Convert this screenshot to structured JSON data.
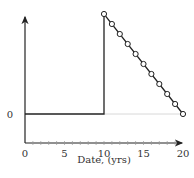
{
  "chart_data": {
    "type": "line",
    "title": "",
    "xlabel": "Date, (yrs)",
    "ylabel": "",
    "xlim": [
      0,
      20
    ],
    "x_ticks": [
      0,
      5,
      10,
      15,
      20
    ],
    "x_tick_labels": [
      "0",
      "5",
      "10",
      "15",
      "20"
    ],
    "x_minor_ticks_every": 1,
    "y_ticks": [
      0
    ],
    "y_tick_labels": [
      "0"
    ],
    "grid": false,
    "legend": null,
    "series": [
      {
        "name": "step-then-decline",
        "style": "solid line",
        "points": [
          [
            0,
            0
          ],
          [
            10,
            0
          ],
          [
            10,
            10
          ],
          [
            20,
            0
          ]
        ]
      },
      {
        "name": "markers",
        "style": "open circles",
        "x": [
          10,
          11,
          12,
          13,
          14,
          15,
          16,
          17,
          18,
          19,
          20
        ],
        "y": [
          10,
          9,
          8,
          7,
          6,
          5,
          4,
          3,
          2,
          1,
          0
        ]
      }
    ],
    "annotations": [
      {
        "type": "reference-line",
        "y": 0,
        "from_x": 10,
        "to_x": 20,
        "color": "#d8d8d8"
      }
    ],
    "colors": {
      "line": "#222222",
      "axis": "#222222",
      "reference": "#d8d8d8"
    }
  }
}
